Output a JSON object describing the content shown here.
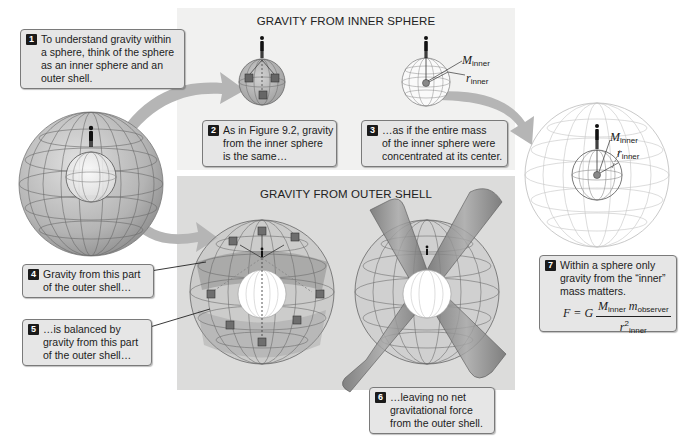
{
  "panels": {
    "inner": {
      "title": "GRAVITY FROM INNER SPHERE",
      "background": "#f1f1f0"
    },
    "outer": {
      "title": "GRAVITY FROM OUTER SHELL",
      "background": "#dcdcdb"
    }
  },
  "callouts": [
    {
      "number": "1",
      "lines": [
        "To understand gravity within",
        "a sphere, think of the sphere",
        "as an inner sphere and an",
        "outer shell."
      ]
    },
    {
      "number": "2",
      "lines": [
        "As in Figure 9.2, gravity",
        "from the inner sphere",
        "is the same…"
      ]
    },
    {
      "number": "3",
      "lines": [
        "…as if the entire mass",
        "of the inner sphere were",
        "concentrated at its center."
      ]
    },
    {
      "number": "4",
      "lines": [
        "Gravity from this part",
        "of the outer shell…"
      ]
    },
    {
      "number": "5",
      "lines": [
        "…is balanced by",
        "gravity from this part",
        "of the outer shell…"
      ]
    },
    {
      "number": "6",
      "lines": [
        "…leaving no net",
        "gravitational force",
        "from the outer shell."
      ]
    },
    {
      "number": "7",
      "lines": [
        "Within a sphere only",
        "gravity from the “inner”",
        "mass matters."
      ]
    }
  ],
  "formula": {
    "lhs": "F = G",
    "numerator_M": "M",
    "numerator_M_sub": "inner",
    "numerator_m": "m",
    "numerator_m_sub": "observer",
    "denominator_r": "r",
    "denominator_r_sup": "2",
    "denominator_r_sub": "inner"
  },
  "labels": {
    "M": "M",
    "M_sub": "inner",
    "r": "r",
    "r_sub": "inner"
  },
  "icons": {
    "observer": "person-silhouette-icon",
    "mass_block": "cube-icon",
    "flow_arrow": "curved-arrow-icon"
  },
  "colors": {
    "sphere_fill": "#b9b9b9",
    "grid_line": "#6f6f6f",
    "arrow": "#b3b3b3",
    "callout_bg": "#e6e6e6",
    "badge": "#1a1a1a"
  }
}
